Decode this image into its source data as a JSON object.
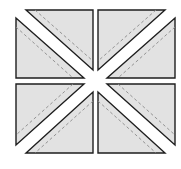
{
  "diagram": {
    "title": "",
    "colors": {
      "background": "#ffffff",
      "fill": "#e2e2e2",
      "stroke": "#1e1e1e",
      "seam": "#8a8a8a"
    },
    "blocks": [
      {
        "id": "top-left",
        "diagonal": "tl-br"
      },
      {
        "id": "top-right",
        "diagonal": "tr-bl"
      },
      {
        "id": "bottom-left",
        "diagonal": "tr-bl"
      },
      {
        "id": "bottom-right",
        "diagonal": "tl-br"
      }
    ]
  }
}
